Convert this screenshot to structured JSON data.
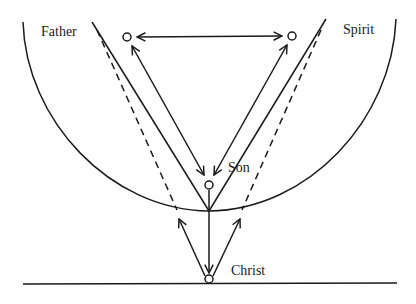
{
  "diagram": {
    "title": "",
    "nodes": [
      {
        "id": "father",
        "label": "Father",
        "cx": 127,
        "cy": 37
      },
      {
        "id": "spirit",
        "label": "Spirit",
        "cx": 292,
        "cy": 36
      },
      {
        "id": "son",
        "label": "Son",
        "cx": 209,
        "cy": 185
      },
      {
        "id": "christ",
        "label": "Christ",
        "cx": 209,
        "cy": 278
      }
    ],
    "edges": [
      {
        "from": "father",
        "to": "spirit",
        "style": "solid",
        "arrows": "both"
      },
      {
        "from": "son",
        "to": "father",
        "style": "solid",
        "arrows": "both"
      },
      {
        "from": "son",
        "to": "spirit",
        "style": "solid",
        "arrows": "both"
      },
      {
        "from": "son",
        "to": "christ",
        "style": "solid",
        "arrows": "end"
      },
      {
        "from": "christ",
        "to": "left-arc",
        "style": "solid",
        "arrows": "end"
      },
      {
        "from": "christ",
        "to": "right-arc",
        "style": "solid",
        "arrows": "end"
      }
    ],
    "shapes": [
      "large-arc",
      "solid-v-left",
      "solid-v-right",
      "dashed-left",
      "dashed-right",
      "baseline"
    ]
  },
  "labels": {
    "father": "Father",
    "spirit": "Spirit",
    "son": "Son",
    "christ": "Christ"
  },
  "colors": {
    "stroke": "#1a1a1a",
    "background": "#ffffff"
  }
}
